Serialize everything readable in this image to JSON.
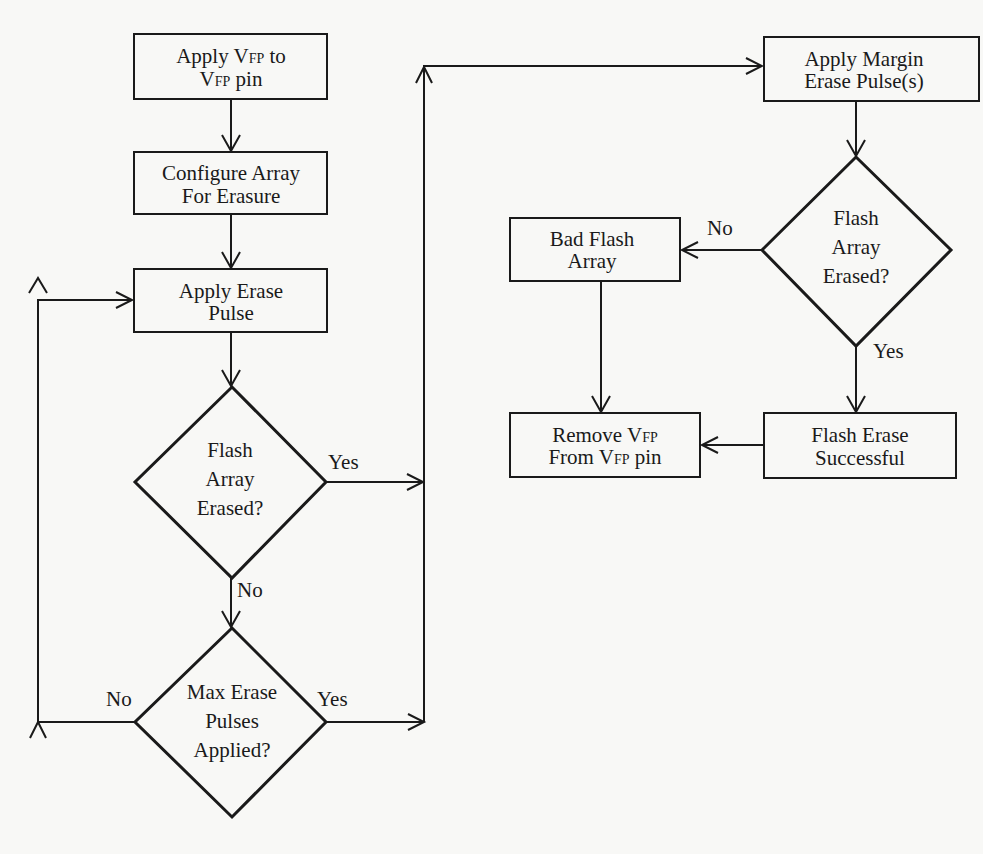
{
  "diagram": {
    "type": "flowchart",
    "nodes": {
      "apply_vfp": {
        "shape": "process",
        "lines": [
          [
            "Apply V",
            "FP",
            " to"
          ],
          [
            "V",
            "FP",
            " pin"
          ]
        ]
      },
      "configure_array": {
        "shape": "process",
        "lines": [
          "Configure Array",
          "For Erasure"
        ]
      },
      "apply_erase_pulse": {
        "shape": "process",
        "lines": [
          "Apply Erase",
          "Pulse"
        ]
      },
      "flash_erased_1": {
        "shape": "decision",
        "lines": [
          "Flash",
          "Array",
          "Erased?"
        ]
      },
      "max_pulses": {
        "shape": "decision",
        "lines": [
          "Max Erase",
          "Pulses",
          "Applied?"
        ]
      },
      "apply_margin": {
        "shape": "process",
        "lines": [
          "Apply Margin",
          "Erase Pulse(s)"
        ]
      },
      "flash_erased_2": {
        "shape": "decision",
        "lines": [
          "Flash",
          "Array",
          "Erased?"
        ]
      },
      "bad_flash": {
        "shape": "process",
        "lines": [
          "Bad Flash",
          "Array"
        ]
      },
      "remove_vfp": {
        "shape": "process",
        "lines": [
          [
            "Remove V",
            "FP",
            ""
          ],
          [
            "From V",
            "FP",
            " pin"
          ]
        ]
      },
      "erase_success": {
        "shape": "process",
        "lines": [
          "Flash Erase",
          "Successful"
        ]
      }
    },
    "edges": [
      {
        "from": "apply_vfp",
        "to": "configure_array",
        "label": ""
      },
      {
        "from": "configure_array",
        "to": "apply_erase_pulse",
        "label": ""
      },
      {
        "from": "apply_erase_pulse",
        "to": "flash_erased_1",
        "label": ""
      },
      {
        "from": "flash_erased_1",
        "to": "apply_margin",
        "label": "Yes"
      },
      {
        "from": "flash_erased_1",
        "to": "max_pulses",
        "label": "No"
      },
      {
        "from": "max_pulses",
        "to": "apply_erase_pulse",
        "label": "No"
      },
      {
        "from": "max_pulses",
        "to": "apply_margin",
        "label": "Yes"
      },
      {
        "from": "apply_margin",
        "to": "flash_erased_2",
        "label": ""
      },
      {
        "from": "flash_erased_2",
        "to": "bad_flash",
        "label": "No"
      },
      {
        "from": "flash_erased_2",
        "to": "erase_success",
        "label": "Yes"
      },
      {
        "from": "bad_flash",
        "to": "remove_vfp",
        "label": ""
      },
      {
        "from": "erase_success",
        "to": "remove_vfp",
        "label": ""
      }
    ],
    "labels": {
      "yes": "Yes",
      "no": "No"
    },
    "colors": {
      "ink": "#1a1a1a",
      "paper": "#f8f8f6"
    }
  }
}
